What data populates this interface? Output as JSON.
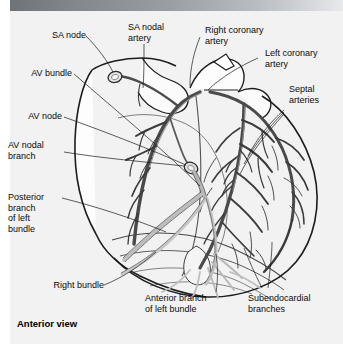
{
  "figure": {
    "view_caption": "Anterior view",
    "background_color": "#f2f2f2",
    "header_bar_color": "#82858a",
    "ink_color": "#2b2b2b"
  },
  "labels": {
    "sa_node": "SA node",
    "sa_nodal_artery": "SA nodal\nartery",
    "right_coronary_artery": "Right coronary\nartery",
    "left_coronary_artery": "Left coronary\nartery",
    "septal_arteries": "Septal\narteries",
    "av_bundle": "AV bundle",
    "av_node": "AV node",
    "av_nodal_branch": "AV nodal\nbranch",
    "posterior_branch_left_bundle": "Posterior\nbranch\nof left\nbundle",
    "right_bundle": "Right bundle",
    "anterior_branch_left_bundle": "Anterior branch\nof left bundle",
    "subendocardial_branches": "Subendocardial\nbranches"
  }
}
